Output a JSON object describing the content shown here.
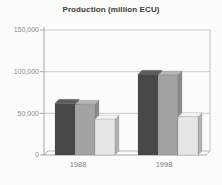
{
  "title": "Production (million ECU)",
  "chart_data": {
    "type": "bar",
    "style": "3d-grouped-bars",
    "title": "Production (million ECU)",
    "categories": [
      "1988",
      "1998"
    ],
    "series": [
      {
        "name": "series-dark",
        "color": "#474747",
        "top_color": "#5c5c5c",
        "side_color": "#333333",
        "values": [
          62000,
          97000
        ]
      },
      {
        "name": "series-medium",
        "color": "#a3a3a3",
        "top_color": "#b6b6b6",
        "side_color": "#8c8c8c",
        "values": [
          61000,
          96000
        ]
      },
      {
        "name": "series-light",
        "color": "#e6e6e3",
        "top_color": "#f3f3f0",
        "side_color": "#b2b2ae",
        "values": [
          43000,
          46000
        ]
      }
    ],
    "xlabel": "",
    "ylabel": "",
    "ylim": [
      0,
      150000
    ],
    "y_ticks": [
      {
        "value": 0,
        "label": "0"
      },
      {
        "value": 50000,
        "label": "50,000"
      },
      {
        "value": 100000,
        "label": "100,000"
      },
      {
        "value": 150000,
        "label": "150,000"
      }
    ],
    "grid": true,
    "legend": "none",
    "colors": {
      "gridline": "#cbcbcb",
      "axis": "#a6a6a6",
      "tick_label": "#8a8a8a",
      "category_label": "#7a7a7a",
      "title": "#3a3a3a",
      "background": "#fcfcfa"
    }
  }
}
